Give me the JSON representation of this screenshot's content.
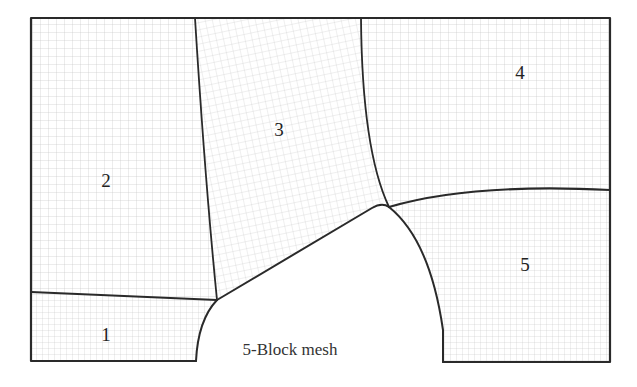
{
  "figure": {
    "caption": "5-Block mesh",
    "blocks": [
      {
        "id": "1",
        "label": "1",
        "x": 106,
        "y": 335
      },
      {
        "id": "2",
        "label": "2",
        "x": 106,
        "y": 181
      },
      {
        "id": "3",
        "label": "3",
        "x": 279,
        "y": 130
      },
      {
        "id": "4",
        "label": "4",
        "x": 520,
        "y": 73
      },
      {
        "id": "5",
        "label": "5",
        "x": 525,
        "y": 265
      }
    ],
    "colors": {
      "boundary": "#2a2a2a",
      "grid": "#b5b5b5",
      "background": "#ffffff"
    }
  }
}
